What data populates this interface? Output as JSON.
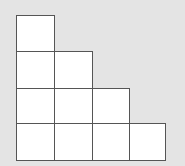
{
  "diagram": {
    "type": "staircase-squares",
    "columns": [
      4,
      3,
      2,
      1
    ],
    "cell_fill": "#ffffff",
    "line_color": "#555555",
    "background": "#e4e4e4",
    "cells": [
      {
        "col": 0,
        "row": 0,
        "x": 16,
        "y": 15,
        "w": 39,
        "h": 37
      },
      {
        "col": 0,
        "row": 1,
        "x": 16,
        "y": 51,
        "w": 39,
        "h": 38
      },
      {
        "col": 1,
        "row": 1,
        "x": 54,
        "y": 51,
        "w": 39,
        "h": 38
      },
      {
        "col": 0,
        "row": 2,
        "x": 16,
        "y": 88,
        "w": 39,
        "h": 36
      },
      {
        "col": 1,
        "row": 2,
        "x": 54,
        "y": 88,
        "w": 39,
        "h": 36
      },
      {
        "col": 2,
        "row": 2,
        "x": 92,
        "y": 88,
        "w": 38,
        "h": 36
      },
      {
        "col": 0,
        "row": 3,
        "x": 16,
        "y": 123,
        "w": 39,
        "h": 38
      },
      {
        "col": 1,
        "row": 3,
        "x": 54,
        "y": 123,
        "w": 39,
        "h": 38
      },
      {
        "col": 2,
        "row": 3,
        "x": 92,
        "y": 123,
        "w": 38,
        "h": 38
      },
      {
        "col": 3,
        "row": 3,
        "x": 129,
        "y": 123,
        "w": 37,
        "h": 38
      }
    ]
  }
}
